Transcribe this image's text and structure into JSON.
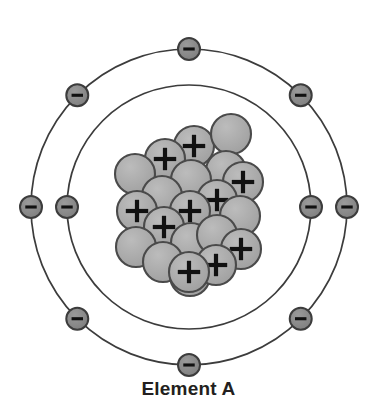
{
  "diagram": {
    "title": "Element A",
    "type": "bohr-atomic-model",
    "center": {
      "x": 189,
      "y": 207
    },
    "colors": {
      "orbit_stroke": "#3c3c3c",
      "particle_fill": "#a8a8a8",
      "particle_stroke": "#4a4a4a",
      "electron_fill": "#8c8c8c",
      "electron_stroke": "#3c3c3c",
      "sign_color": "#111111",
      "label_color": "#231f20",
      "background": "#ffffff"
    },
    "shells": [
      {
        "name": "inner-shell",
        "radius": 122,
        "electron_count": 2,
        "stroke_width": 1.7,
        "electrons": [
          {
            "name": "electron-inner-left",
            "angle": 180,
            "sign": "−"
          },
          {
            "name": "electron-inner-right",
            "angle": 0,
            "sign": "−"
          }
        ]
      },
      {
        "name": "outer-shell",
        "radius": 158,
        "electron_count": 8,
        "stroke_width": 1.7,
        "electrons": [
          {
            "name": "electron-outer-top",
            "angle": 270,
            "sign": "−"
          },
          {
            "name": "electron-outer-top-right",
            "angle": 315,
            "sign": "−"
          },
          {
            "name": "electron-outer-right",
            "angle": 0,
            "sign": "−"
          },
          {
            "name": "electron-outer-bottom-right",
            "angle": 45,
            "sign": "−"
          },
          {
            "name": "electron-outer-bottom",
            "angle": 90,
            "sign": "−"
          },
          {
            "name": "electron-outer-bottom-left",
            "angle": 135,
            "sign": "−"
          },
          {
            "name": "electron-outer-left",
            "angle": 180,
            "sign": "−"
          },
          {
            "name": "electron-outer-top-left",
            "angle": 225,
            "sign": "−"
          }
        ]
      }
    ],
    "electron_radius": 11,
    "electron_sign": "−",
    "proton_sign": "+",
    "nucleus": {
      "name": "nucleus",
      "particle_radius": 20,
      "proton_count": 10,
      "neutron_count": 11,
      "total_particles": 21,
      "particles": [
        {
          "name": "proton",
          "x": 194,
          "y": 146,
          "charge": "+"
        },
        {
          "name": "neutron",
          "x": 231,
          "y": 134,
          "charge": ""
        },
        {
          "name": "proton",
          "x": 165,
          "y": 159,
          "charge": "+"
        },
        {
          "name": "neutron",
          "x": 226,
          "y": 171,
          "charge": ""
        },
        {
          "name": "neutron",
          "x": 191,
          "y": 180,
          "charge": ""
        },
        {
          "name": "neutron",
          "x": 135,
          "y": 174,
          "charge": ""
        },
        {
          "name": "neutron",
          "x": 162,
          "y": 196,
          "charge": ""
        },
        {
          "name": "proton",
          "x": 243,
          "y": 182,
          "charge": "+"
        },
        {
          "name": "proton",
          "x": 217,
          "y": 200,
          "charge": "+"
        },
        {
          "name": "proton",
          "x": 137,
          "y": 211,
          "charge": "+"
        },
        {
          "name": "proton",
          "x": 190,
          "y": 211,
          "charge": "+"
        },
        {
          "name": "proton",
          "x": 164,
          "y": 227,
          "charge": "+"
        },
        {
          "name": "neutron",
          "x": 240,
          "y": 216,
          "charge": ""
        },
        {
          "name": "neutron",
          "x": 136,
          "y": 247,
          "charge": ""
        },
        {
          "name": "neutron",
          "x": 191,
          "y": 243,
          "charge": ""
        },
        {
          "name": "neutron",
          "x": 217,
          "y": 235,
          "charge": ""
        },
        {
          "name": "proton",
          "x": 241,
          "y": 249,
          "charge": "+"
        },
        {
          "name": "neutron",
          "x": 163,
          "y": 262,
          "charge": ""
        },
        {
          "name": "neutron",
          "x": 190,
          "y": 276,
          "charge": ""
        },
        {
          "name": "proton",
          "x": 216,
          "y": 265,
          "charge": "+"
        },
        {
          "name": "proton",
          "x": 189,
          "y": 272,
          "charge": "+"
        }
      ]
    }
  }
}
